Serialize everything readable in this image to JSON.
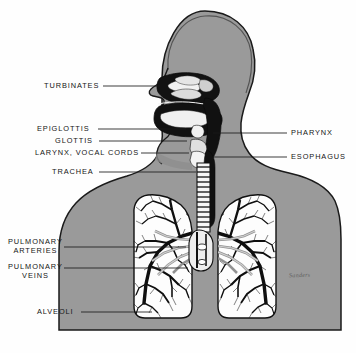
{
  "diagram": {
    "colors": {
      "body_fill": "#9a9a9a",
      "body_outline": "#1a1a1a",
      "airway_dark": "#111111",
      "lung_fill": "#fdfdfd",
      "bronchi": "#111111",
      "background": "#fefefe",
      "label_text": "#151515",
      "leader_line": "#1a1a1a"
    },
    "signature": "Sanders"
  },
  "labels": {
    "left": [
      {
        "id": "turbinates",
        "lines": [
          "TURBINATES"
        ],
        "text_x": 44,
        "text_y": 82,
        "leader_from_x": 103,
        "leader_to_x": 160,
        "leader_y": 86
      },
      {
        "id": "epiglottis",
        "lines": [
          "EPIGLOTTIS"
        ],
        "text_x": 37,
        "text_y": 125,
        "leader_from_x": 98,
        "leader_to_x": 186,
        "leader_y": 129
      },
      {
        "id": "glottis",
        "lines": [
          "GLOTTIS"
        ],
        "text_x": 55,
        "text_y": 137,
        "leader_from_x": 99,
        "leader_to_x": 187,
        "leader_y": 141
      },
      {
        "id": "larynx-vocal-cords",
        "lines": [
          "LARYNX, VOCAL CORDS"
        ],
        "text_x": 35,
        "text_y": 149,
        "leader_from_x": 141,
        "leader_to_x": 189,
        "leader_y": 153
      },
      {
        "id": "trachea",
        "lines": [
          "TRACHEA"
        ],
        "text_x": 52,
        "text_y": 168,
        "leader_from_x": 99,
        "leader_to_x": 196,
        "leader_y": 172
      },
      {
        "id": "pulmonary-arteries",
        "lines": [
          "PULMONARY",
          "ARTERIES"
        ],
        "text_x": 8,
        "text_y": 238,
        "leader_from_x": 64,
        "leader_to_x": 186,
        "leader_y": 247
      },
      {
        "id": "pulmonary-veins",
        "lines": [
          "PULMONARY",
          "VEINS"
        ],
        "text_x": 8,
        "text_y": 263,
        "leader_from_x": 64,
        "leader_to_x": 188,
        "leader_y": 268
      },
      {
        "id": "alveoli",
        "lines": [
          "ALVEOLI"
        ],
        "text_x": 37,
        "text_y": 308,
        "leader_from_x": 81,
        "leader_to_x": 152,
        "leader_y": 312
      }
    ],
    "right": [
      {
        "id": "pharynx",
        "lines": [
          "PHARYNX"
        ],
        "text_x": 291,
        "text_y": 129,
        "leader_from_x": 213,
        "leader_to_x": 287,
        "leader_y": 133
      },
      {
        "id": "esophagus",
        "lines": [
          "ESOPHAGUS"
        ],
        "text_x": 291,
        "text_y": 153,
        "leader_from_x": 213,
        "leader_to_x": 287,
        "leader_y": 157
      }
    ]
  }
}
